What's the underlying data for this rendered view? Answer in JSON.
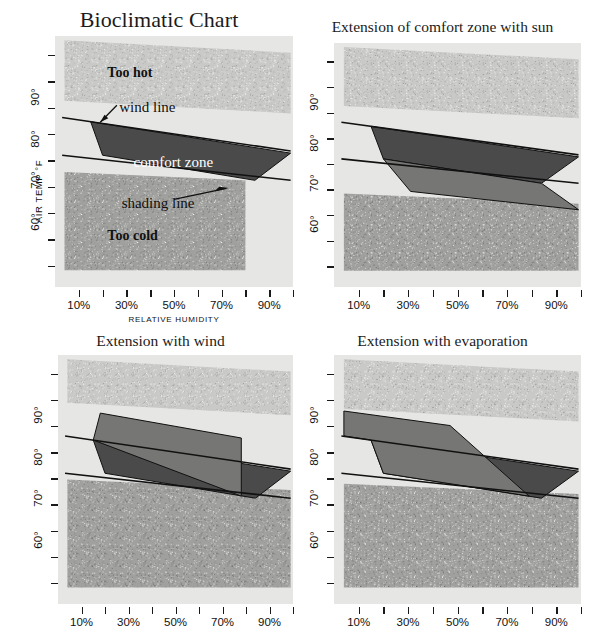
{
  "figure": {
    "width": 597,
    "height": 640,
    "background": "#ffffff"
  },
  "colors": {
    "plot_background": "#e6e6e4",
    "too_hot_fill": "#c9c9c7",
    "too_cold_fill": "#a0a09e",
    "comfort_zone_fill": "#4a4a4a",
    "extension_fill": "#767674",
    "line_color": "#111111",
    "text_color": "#1b1b1b"
  },
  "axes": {
    "y_title": "AIR TEMP °F",
    "y_ticks": [
      "90°",
      "80°",
      "70°",
      "60°"
    ],
    "y_tick_values": [
      90,
      80,
      70,
      60
    ],
    "y_minor_count": 9,
    "x_title": "RELATIVE HUMIDITY",
    "x_ticks": [
      "10%",
      "30%",
      "50%",
      "70%",
      "90%"
    ],
    "x_tick_values": [
      10,
      30,
      50,
      70,
      90
    ],
    "x_minor_values": [
      20,
      40,
      60,
      80,
      100
    ],
    "xlim": [
      0,
      100
    ],
    "ylim": [
      45,
      105
    ]
  },
  "panels": [
    {
      "id": "bioclimatic-chart",
      "title": "Bioclimatic Chart",
      "zone_labels": [
        {
          "text": "Too hot",
          "x": 22,
          "y": 96
        },
        {
          "text": "Too cold",
          "x": 22,
          "y": 57
        }
      ],
      "annotations": [
        {
          "text": "wind line",
          "x": 27,
          "y": 87.5
        },
        {
          "text": "comfort zone",
          "x": 33,
          "y": 74.5
        },
        {
          "text": "shading line",
          "x": 28,
          "y": 64.5
        }
      ]
    },
    {
      "id": "extension-with-sun",
      "title": "Extension of comfort zone with sun",
      "zone_labels": [],
      "annotations": []
    },
    {
      "id": "extension-with-wind",
      "title": "Extension with wind",
      "zone_labels": [],
      "annotations": []
    },
    {
      "id": "extension-with-evaporation",
      "title": "Extension with evaporation",
      "zone_labels": [],
      "annotations": []
    }
  ],
  "chart_data": {
    "type": "area",
    "title": "Bioclimatic Chart",
    "xlabel": "RELATIVE HUMIDITY",
    "ylabel": "AIR TEMP °F",
    "xlim": [
      0,
      100
    ],
    "ylim": [
      45,
      105
    ],
    "grid": false,
    "legend": "none",
    "subplots": [
      {
        "name": "Bioclimatic Chart",
        "regions": [
          {
            "name": "too-hot",
            "label": "Too hot",
            "fill": "#c9c9c7",
            "texture": "stipple",
            "polygon": [
              [
                4,
                104
              ],
              [
                99,
                101
              ],
              [
                99,
                86.5
              ],
              [
                4,
                89.5
              ]
            ]
          },
          {
            "name": "too-cold",
            "label": "Too cold",
            "fill": "#a0a09e",
            "texture": "stipple",
            "polygon": [
              [
                4,
                72.5
              ],
              [
                80,
                70.5
              ],
              [
                80,
                49
              ],
              [
                4,
                49
              ]
            ]
          },
          {
            "name": "comfort-zone",
            "label": "comfort zone",
            "fill": "#4a4a4a",
            "polygon": [
              [
                15,
                84.5
              ],
              [
                99,
                77
              ],
              [
                84,
                70.5
              ],
              [
                20,
                76.5
              ]
            ]
          }
        ],
        "lines": [
          {
            "name": "wind-line",
            "points": [
              [
                3,
                85.5
              ],
              [
                99,
                77.5
              ]
            ]
          },
          {
            "name": "shading-line",
            "points": [
              [
                3,
                76.5
              ],
              [
                99,
                70.5
              ]
            ]
          }
        ]
      },
      {
        "name": "Extension of comfort zone with sun",
        "regions": [
          {
            "name": "too-hot",
            "fill": "#c9c9c7",
            "texture": "stipple",
            "polygon": [
              [
                4,
                104
              ],
              [
                99,
                101
              ],
              [
                99,
                86.5
              ],
              [
                4,
                89.5
              ]
            ]
          },
          {
            "name": "too-cold",
            "fill": "#a0a09e",
            "texture": "stipple",
            "polygon": [
              [
                4,
                68
              ],
              [
                99,
                65.5
              ],
              [
                99,
                49
              ],
              [
                4,
                49
              ]
            ]
          },
          {
            "name": "comfort-zone",
            "fill": "#4a4a4a",
            "polygon": [
              [
                15,
                84.5
              ],
              [
                99,
                77
              ],
              [
                84,
                70.5
              ],
              [
                20,
                76.5
              ]
            ]
          },
          {
            "name": "sun-extension",
            "fill": "#767674",
            "polygon": [
              [
                20,
                76.5
              ],
              [
                84,
                70.5
              ],
              [
                99,
                64
              ],
              [
                31,
                68.5
              ]
            ]
          }
        ],
        "lines": [
          {
            "name": "wind-line",
            "points": [
              [
                3,
                85.5
              ],
              [
                99,
                77.5
              ]
            ]
          },
          {
            "name": "shading-line",
            "points": [
              [
                3,
                76.5
              ],
              [
                99,
                70.5
              ]
            ]
          }
        ]
      },
      {
        "name": "Extension with wind",
        "regions": [
          {
            "name": "too-hot",
            "fill": "#c9c9c7",
            "texture": "stipple",
            "polygon": [
              [
                4,
                104
              ],
              [
                99,
                101
              ],
              [
                99,
                90.5
              ],
              [
                4,
                93.5
              ]
            ]
          },
          {
            "name": "too-cold",
            "fill": "#a0a09e",
            "texture": "stipple",
            "polygon": [
              [
                4,
                75
              ],
              [
                99,
                72.5
              ],
              [
                99,
                49
              ],
              [
                4,
                49
              ]
            ]
          },
          {
            "name": "comfort-zone",
            "fill": "#4a4a4a",
            "polygon": [
              [
                15,
                84.5
              ],
              [
                99,
                77
              ],
              [
                84,
                70.5
              ],
              [
                20,
                76.5
              ]
            ]
          },
          {
            "name": "wind-extension",
            "fill": "#767674",
            "polygon": [
              [
                18,
                91
              ],
              [
                78,
                85
              ],
              [
                78,
                71
              ],
              [
                15,
                84.5
              ]
            ]
          }
        ],
        "lines": [
          {
            "name": "wind-line",
            "points": [
              [
                3,
                85.5
              ],
              [
                99,
                77.5
              ]
            ]
          },
          {
            "name": "shading-line",
            "points": [
              [
                3,
                76.5
              ],
              [
                99,
                70.5
              ]
            ]
          }
        ]
      },
      {
        "name": "Extension with evaporation",
        "regions": [
          {
            "name": "too-hot",
            "fill": "#c9c9c7",
            "texture": "stipple",
            "polygon": [
              [
                4,
                104
              ],
              [
                99,
                101
              ],
              [
                99,
                89
              ],
              [
                4,
                92
              ]
            ]
          },
          {
            "name": "too-cold",
            "fill": "#a0a09e",
            "texture": "stipple",
            "polygon": [
              [
                4,
                74
              ],
              [
                99,
                71.5
              ],
              [
                99,
                49
              ],
              [
                4,
                49
              ]
            ]
          },
          {
            "name": "comfort-zone",
            "fill": "#4a4a4a",
            "polygon": [
              [
                15,
                84.5
              ],
              [
                99,
                77
              ],
              [
                84,
                70.5
              ],
              [
                20,
                76.5
              ]
            ]
          },
          {
            "name": "evaporation-extension",
            "fill": "#767674",
            "polygon": [
              [
                4,
                91.5
              ],
              [
                47,
                88
              ],
              [
                79,
                71
              ],
              [
                20,
                76.5
              ],
              [
                15,
                84.5
              ],
              [
                4,
                85.5
              ]
            ]
          }
        ],
        "lines": [
          {
            "name": "wind-line",
            "points": [
              [
                3,
                85.5
              ],
              [
                99,
                77.5
              ]
            ]
          },
          {
            "name": "shading-line",
            "points": [
              [
                3,
                76.5
              ],
              [
                99,
                70.5
              ]
            ]
          }
        ]
      }
    ]
  }
}
